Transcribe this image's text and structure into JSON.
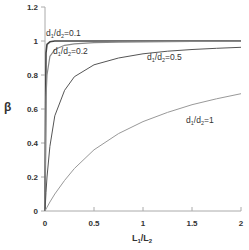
{
  "chart_data": {
    "type": "line",
    "title": "",
    "xlabel": "L1/L2",
    "ylabel": "β",
    "xlim": [
      0,
      2
    ],
    "ylim": [
      0,
      1.2
    ],
    "grid": false,
    "legend": "inline labels on curves",
    "x_ticks": [
      "0",
      "0.5",
      "1",
      "1.5",
      "2"
    ],
    "y_ticks": [
      "0",
      "0.2",
      "0.4",
      "0.6",
      "0.8",
      "1",
      "1.2"
    ],
    "x": [
      0,
      0.01,
      0.02,
      0.05,
      0.1,
      0.2,
      0.3,
      0.5,
      0.75,
      1.0,
      1.25,
      1.5,
      1.75,
      2.0
    ],
    "series": [
      {
        "name": "d1/d2=0.1",
        "label": "d₁/d₂=0.1",
        "color": "#444444",
        "width": 1.6,
        "values": [
          0,
          0.93,
          0.98,
          0.995,
          1.0,
          1.0,
          1.0,
          1.0,
          1.0,
          1.0,
          1.0,
          1.0,
          1.0,
          1.0
        ]
      },
      {
        "name": "d1/d2=0.2",
        "label": "d₁/d₂=0.2",
        "color": "#888888",
        "width": 1.2,
        "values": [
          0,
          0.67,
          0.8,
          0.91,
          0.95,
          0.975,
          0.983,
          0.99,
          0.993,
          0.995,
          0.996,
          0.997,
          0.997,
          0.998
        ]
      },
      {
        "name": "d1/d2=0.5",
        "label": "d₁/d₂=0.5",
        "color": "#555555",
        "width": 1.0,
        "values": [
          0,
          0.11,
          0.2,
          0.38,
          0.56,
          0.71,
          0.79,
          0.86,
          0.9,
          0.925,
          0.94,
          0.95,
          0.957,
          0.963
        ]
      },
      {
        "name": "d1/d2=1",
        "label": "d₁/d₂=1",
        "color": "#999999",
        "width": 1.0,
        "values": [
          0,
          0.011,
          0.022,
          0.053,
          0.1,
          0.18,
          0.25,
          0.36,
          0.455,
          0.526,
          0.58,
          0.625,
          0.66,
          0.69
        ]
      }
    ]
  },
  "axes": {
    "ylabel": "β",
    "xlabel_main": "L",
    "xlabel_sub1": "1",
    "xlabel_sep": "/L",
    "xlabel_sub2": "2"
  },
  "labels": {
    "c01": {
      "pre": "d",
      "s1": "1",
      "mid": "/d",
      "s2": "2",
      "post": "=0.1"
    },
    "c02": {
      "pre": "d",
      "s1": "1",
      "mid": "/d",
      "s2": "2",
      "post": "=0.2"
    },
    "c05": {
      "pre": "d",
      "s1": "1",
      "mid": "/d",
      "s2": "2",
      "post": "=0.5"
    },
    "c1": {
      "pre": "d",
      "s1": "1",
      "mid": "/d",
      "s2": "2",
      "post": "=1"
    }
  }
}
